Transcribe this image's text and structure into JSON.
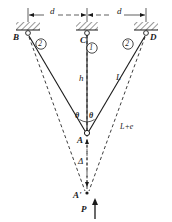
{
  "figure": {
    "type": "three-bar-truss-deflection-diagram",
    "geometry": {
      "supports": [
        {
          "id": "B",
          "x": 28,
          "y": 33,
          "label": "B",
          "label_x": 13,
          "label_y": 34
        },
        {
          "id": "C",
          "x": 87,
          "y": 33,
          "label": "C",
          "label_x": 80,
          "label_y": 44
        },
        {
          "id": "D",
          "x": 146,
          "y": 33,
          "label": "D",
          "label_x": 150,
          "label_y": 34
        }
      ],
      "apex": {
        "id": "A",
        "x": 87,
        "y": 133,
        "label": "A",
        "label_x": 78,
        "label_y": 143
      },
      "apex_moved": {
        "id": "A'",
        "x": 87,
        "y": 193,
        "label": "A'",
        "label_x": 74,
        "label_y": 198
      }
    },
    "members": [
      {
        "id": "m1",
        "number": "1",
        "from": "C",
        "to": "A",
        "style": "solid",
        "badge_x": 92,
        "badge_y": 48
      },
      {
        "id": "m2l",
        "number": "2",
        "from": "B",
        "to": "A",
        "style": "solid",
        "badge_x": 41,
        "badge_y": 44
      },
      {
        "id": "m2r",
        "number": "2",
        "from": "D",
        "to": "A",
        "style": "solid",
        "badge_x": 128,
        "badge_y": 44
      }
    ],
    "deformed_members": [
      {
        "id": "d1",
        "from": "C",
        "to": "A'",
        "style": "dashed"
      },
      {
        "id": "d2l",
        "from": "B",
        "to": "A'",
        "style": "dashed"
      },
      {
        "id": "d2r",
        "from": "D",
        "to": "A'",
        "style": "dashed"
      }
    ],
    "dimensions": [
      {
        "id": "dim-left",
        "label": "d",
        "x": 50,
        "y": 14
      },
      {
        "id": "dim-right",
        "label": "d",
        "x": 117,
        "y": 14
      },
      {
        "id": "delta",
        "label": "Δ",
        "x": 79,
        "y": 163
      }
    ],
    "labels": [
      {
        "id": "h",
        "text": "h",
        "x": 79,
        "y": 79
      },
      {
        "id": "L",
        "text": "L",
        "x": 116,
        "y": 78
      },
      {
        "id": "L-plus-e",
        "text": "L+e",
        "x": 120,
        "y": 128
      },
      {
        "id": "theta-left",
        "text": "θ",
        "x": 75,
        "y": 117
      },
      {
        "id": "theta-right",
        "text": "θ",
        "x": 90,
        "y": 117
      }
    ],
    "load": {
      "id": "P",
      "text": "P",
      "x": 82,
      "y": 210,
      "direction": "up",
      "arrow_x": 95,
      "arrow_y_tail": 218,
      "arrow_y_head": 200
    }
  },
  "colors": {
    "line": "#1a1a1a",
    "background": "#ffffff",
    "hatch": "#1a1a1a"
  }
}
